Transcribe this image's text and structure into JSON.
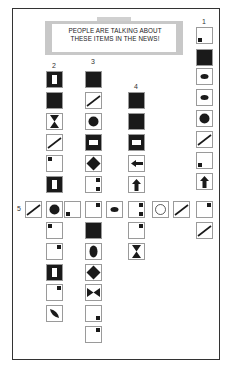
{
  "banner": {
    "line1": "PEOPLE ARE TALKING ABOUT",
    "line2": "THESE ITEMS IN THE NEWS!"
  },
  "colors": {
    "ink": "#1a1a1a",
    "border": "#9a9a9a",
    "banner": "#c8c8c8"
  },
  "columns": [
    {
      "label": "1",
      "x": 196,
      "y_label": 18,
      "cells": [
        {
          "y": 27,
          "icon": "square-bottom-left"
        },
        {
          "y": 49,
          "icon": "filled-square"
        },
        {
          "y": 68,
          "icon": "ellipse"
        },
        {
          "y": 89,
          "icon": "ellipse"
        },
        {
          "y": 110,
          "icon": "circle"
        },
        {
          "y": 131,
          "icon": "diagonal-line"
        },
        {
          "y": 152,
          "icon": "square-bottom-left"
        },
        {
          "y": 173,
          "icon": "up-arrow"
        },
        {
          "y": 201,
          "icon": "square-top-right"
        },
        {
          "y": 222,
          "icon": "diagonal-line"
        }
      ]
    },
    {
      "label": "2",
      "x": 46,
      "y_label": 62,
      "cells": [
        {
          "y": 71,
          "icon": "hollow-bar"
        },
        {
          "y": 92,
          "icon": "filled-square"
        },
        {
          "y": 113,
          "icon": "hourglass"
        },
        {
          "y": 134,
          "icon": "diagonal-line"
        },
        {
          "y": 155,
          "icon": "square-top-left"
        },
        {
          "y": 176,
          "icon": "hollow-bar"
        },
        {
          "y": 201,
          "icon": "circle"
        },
        {
          "y": 222,
          "icon": "square-top-left"
        },
        {
          "y": 243,
          "icon": "square-top-right"
        },
        {
          "y": 264,
          "icon": "hollow-bar"
        },
        {
          "y": 284,
          "icon": "square-top-right"
        },
        {
          "y": 305,
          "icon": "leaf"
        }
      ]
    },
    {
      "label": "3",
      "x": 85,
      "y_label": 58,
      "cells": [
        {
          "y": 71,
          "icon": "filled-square"
        },
        {
          "y": 92,
          "icon": "diagonal-line"
        },
        {
          "y": 113,
          "icon": "circle"
        },
        {
          "y": 134,
          "icon": "hollow-rect"
        },
        {
          "y": 155,
          "icon": "diamond"
        },
        {
          "y": 176,
          "icon": "two-squares-right"
        },
        {
          "y": 201,
          "icon": "square-top-right"
        },
        {
          "y": 222,
          "icon": "filled-square"
        },
        {
          "y": 243,
          "icon": "vertical-ellipse"
        },
        {
          "y": 264,
          "icon": "diamond"
        },
        {
          "y": 284,
          "icon": "bowtie"
        },
        {
          "y": 305,
          "icon": "square-bottom-right"
        },
        {
          "y": 326,
          "icon": "square-top-right"
        }
      ]
    },
    {
      "label": "4",
      "x": 128,
      "y_label": 83,
      "cells": [
        {
          "y": 92,
          "icon": "filled-square"
        },
        {
          "y": 113,
          "icon": "filled-square"
        },
        {
          "y": 134,
          "icon": "hollow-rect"
        },
        {
          "y": 155,
          "icon": "left-arrow"
        },
        {
          "y": 176,
          "icon": "up-arrow"
        },
        {
          "y": 201,
          "icon": "two-squares-right"
        },
        {
          "y": 222,
          "icon": "square-top-right"
        },
        {
          "y": 243,
          "icon": "hourglass"
        }
      ]
    }
  ],
  "row5": {
    "label": "5",
    "x_label": 17,
    "y": 201,
    "cells": [
      {
        "x": 25,
        "icon": "diagonal-line"
      },
      {
        "x": 46,
        "icon": "circle"
      },
      {
        "x": 64,
        "icon": "square-bottom-left"
      },
      {
        "x": 85,
        "icon": "square-top-right"
      },
      {
        "x": 106,
        "icon": "ellipse"
      },
      {
        "x": 128,
        "icon": "two-squares-right"
      },
      {
        "x": 152,
        "icon": "hollow-circle"
      },
      {
        "x": 173,
        "icon": "diagonal-line"
      },
      {
        "x": 196,
        "icon": "square-top-right"
      }
    ]
  }
}
